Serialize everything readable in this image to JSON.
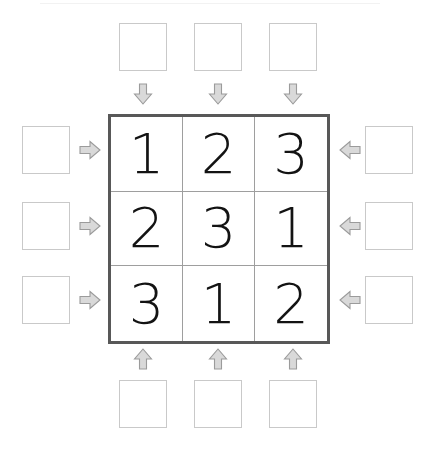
{
  "puzzle": {
    "type": "skyscrapers",
    "size": 3,
    "grid_rows": [
      {
        "cells": [
          {
            "value": "1"
          },
          {
            "value": "2"
          },
          {
            "value": "3"
          }
        ]
      },
      {
        "cells": [
          {
            "value": "2"
          },
          {
            "value": "3"
          },
          {
            "value": "1"
          }
        ]
      },
      {
        "cells": [
          {
            "value": "3"
          },
          {
            "value": "1"
          },
          {
            "value": "2"
          }
        ]
      }
    ],
    "clues": {
      "top": [
        {
          "value": ""
        },
        {
          "value": ""
        },
        {
          "value": ""
        }
      ],
      "left": [
        {
          "value": ""
        },
        {
          "value": ""
        },
        {
          "value": ""
        }
      ],
      "right": [
        {
          "value": ""
        },
        {
          "value": ""
        },
        {
          "value": ""
        }
      ],
      "bottom": [
        {
          "value": ""
        },
        {
          "value": ""
        },
        {
          "value": ""
        }
      ]
    },
    "arrows": {
      "top": [
        "arrow-down-icon",
        "arrow-down-icon",
        "arrow-down-icon"
      ],
      "left": [
        "arrow-right-icon",
        "arrow-right-icon",
        "arrow-right-icon"
      ],
      "right": [
        "arrow-left-icon",
        "arrow-left-icon",
        "arrow-left-icon"
      ],
      "bottom": [
        "arrow-up-icon",
        "arrow-up-icon",
        "arrow-up-icon"
      ]
    },
    "colors": {
      "grid_border": "#585858",
      "grid_inner_line": "#9e9e9e",
      "digit": "#131313",
      "clue_box_border": "#c9c9c9",
      "arrow_fill": "#d9d9d9",
      "arrow_stroke": "#9b9b9b",
      "background": "#ffffff"
    }
  }
}
